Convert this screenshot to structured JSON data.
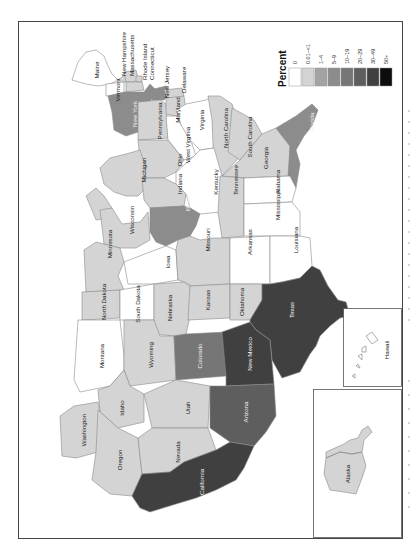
{
  "legend": {
    "title": "Percent",
    "categories": [
      {
        "label": "0",
        "color": "#ffffff"
      },
      {
        "label": "0.01–<1",
        "color": "#d4d4d4"
      },
      {
        "label": "1–4",
        "color": "#a3a3a3"
      },
      {
        "label": "5–9",
        "color": "#8c8c8c"
      },
      {
        "label": "10–19",
        "color": "#767676"
      },
      {
        "label": "20–29",
        "color": "#5e5e5e"
      },
      {
        "label": "30–49",
        "color": "#404040"
      },
      {
        "label": "50+",
        "color": "#0d0d0d"
      }
    ]
  },
  "orientation": "rotated 90° counter-clockwise (north points left)",
  "states": {
    "maine": {
      "label": "Maine",
      "category": "0"
    },
    "new_hampshire": {
      "label": "New Hampshire",
      "category": "0.01–<1"
    },
    "vermont": {
      "label": "Vermont",
      "category": "0"
    },
    "massachusetts": {
      "label": "Massachusetts",
      "category": "0.01–<1"
    },
    "rhode_island": {
      "label": "Rhode Island",
      "category": "0.01–<1"
    },
    "connecticut": {
      "label": "Connecticut",
      "category": "0.01–<1"
    },
    "new_york": {
      "label": "New York",
      "category": "5–9"
    },
    "new_jersey": {
      "label": "New Jersey",
      "category": "5–9"
    },
    "pennsylvania": {
      "label": "Pennsylvania",
      "category": "0.01–<1"
    },
    "delaware": {
      "label": "Delaware",
      "category": "0.01–<1"
    },
    "maryland": {
      "label": "Maryland",
      "category": "0.01–<1"
    },
    "virginia": {
      "label": "Virginia",
      "category": "0"
    },
    "west_virginia": {
      "label": "West Virginia",
      "category": "0"
    },
    "north_carolina": {
      "label": "North Carolina",
      "category": "0.01–<1"
    },
    "south_carolina": {
      "label": "South Carolina",
      "category": "0.01–<1"
    },
    "georgia": {
      "label": "Georgia",
      "category": "0.01–<1"
    },
    "florida": {
      "label": "Florida",
      "category": "5–9"
    },
    "ohio": {
      "label": "Ohio",
      "category": "0.01–<1"
    },
    "michigan": {
      "label": "Michigan",
      "category": "0.01–<1"
    },
    "indiana": {
      "label": "Indiana",
      "category": "0.01–<1"
    },
    "kentucky": {
      "label": "Kentucky",
      "category": "0"
    },
    "tennessee": {
      "label": "Tennessee",
      "category": "0.01–<1"
    },
    "alabama": {
      "label": "Alabama",
      "category": "0"
    },
    "mississippi": {
      "label": "Mississippi",
      "category": "0"
    },
    "illinois": {
      "label": "Illinois",
      "category": "5–9"
    },
    "wisconsin": {
      "label": "Wisconsin",
      "category": "0.01–<1"
    },
    "minnesota": {
      "label": "Minnesota",
      "category": "0.01–<1"
    },
    "iowa": {
      "label": "Iowa",
      "category": "0"
    },
    "missouri": {
      "label": "Missouri",
      "category": "0.01–<1"
    },
    "arkansas": {
      "label": "Arkansas",
      "category": "0"
    },
    "louisiana": {
      "label": "Louisiana",
      "category": "0"
    },
    "north_dakota": {
      "label": "North Dakota",
      "category": "0.01–<1"
    },
    "south_dakota": {
      "label": "South Dakota",
      "category": "0"
    },
    "nebraska": {
      "label": "Nebraska",
      "category": "0.01–<1"
    },
    "kansas": {
      "label": "Kansas",
      "category": "0.01–<1"
    },
    "oklahoma": {
      "label": "Oklahoma",
      "category": "0.01–<1"
    },
    "texas": {
      "label": "Texas",
      "category": "30–49"
    },
    "montana": {
      "label": "Montana",
      "category": "0"
    },
    "wyoming": {
      "label": "Wyoming",
      "category": "0.01–<1"
    },
    "colorado": {
      "label": "Colorado",
      "category": "10–19"
    },
    "new_mexico": {
      "label": "New Mexico",
      "category": "30–49"
    },
    "idaho": {
      "label": "Idaho",
      "category": "0.01–<1"
    },
    "utah": {
      "label": "Utah",
      "category": "0.01–<1"
    },
    "arizona": {
      "label": "Arizona",
      "category": "20–29"
    },
    "washington": {
      "label": "Washington",
      "category": "0.01–<1"
    },
    "oregon": {
      "label": "Oregon",
      "category": "0.01–<1"
    },
    "nevada": {
      "label": "Nevada",
      "category": "0.01–<1"
    },
    "california": {
      "label": "California",
      "category": "30–49"
    },
    "alaska": {
      "label": "Alaska",
      "category": "0.01–<1"
    },
    "hawaii": {
      "label": "Hawaii",
      "category": "0"
    }
  }
}
